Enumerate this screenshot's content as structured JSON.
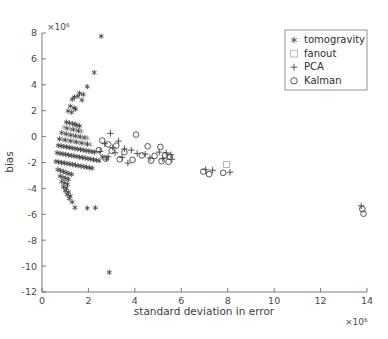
{
  "chart_data": {
    "type": "scatter",
    "title": "",
    "xlabel": "standard deviation in error",
    "ylabel": "bias",
    "x_exponent": "×10⁶",
    "y_exponent": "×10⁶",
    "xlim": [
      0,
      14
    ],
    "ylim": [
      -12,
      8
    ],
    "xticks": [
      0,
      2,
      4,
      6,
      8,
      10,
      12,
      14
    ],
    "yticks": [
      -12,
      -10,
      -8,
      -6,
      -4,
      -2,
      0,
      2,
      4,
      6,
      8
    ],
    "xticklabels": [
      "0",
      "2",
      "4",
      "6",
      "8",
      "10",
      "12",
      "14"
    ],
    "yticklabels": [
      "-12",
      "-10",
      "-8",
      "-6",
      "-4",
      "-2",
      "0",
      "2",
      "4",
      "6",
      "8"
    ],
    "grid": false,
    "legend_position": "upper right",
    "units_note": "axis values in units of 1e6",
    "series": [
      {
        "name": "tomogravity",
        "marker": "asterisk",
        "color": "#3a3a3a",
        "points": [
          [
            2.55,
            7.75
          ],
          [
            2.25,
            4.95
          ],
          [
            1.95,
            3.85
          ],
          [
            1.62,
            3.35
          ],
          [
            1.78,
            3.25
          ],
          [
            1.55,
            3.12
          ],
          [
            1.4,
            3.05
          ],
          [
            1.3,
            2.88
          ],
          [
            1.72,
            2.82
          ],
          [
            1.22,
            2.35
          ],
          [
            1.38,
            2.22
          ],
          [
            1.45,
            2.12
          ],
          [
            1.12,
            1.98
          ],
          [
            1.28,
            1.88
          ],
          [
            1.05,
            1.12
          ],
          [
            1.18,
            1.05
          ],
          [
            1.32,
            1.0
          ],
          [
            1.42,
            0.95
          ],
          [
            1.5,
            0.88
          ],
          [
            1.62,
            0.82
          ],
          [
            0.95,
            0.72
          ],
          [
            1.08,
            0.65
          ],
          [
            1.22,
            0.6
          ],
          [
            1.35,
            0.55
          ],
          [
            1.48,
            0.5
          ],
          [
            1.58,
            0.45
          ],
          [
            1.7,
            0.4
          ],
          [
            0.85,
            0.3
          ],
          [
            0.95,
            0.25
          ],
          [
            1.05,
            0.2
          ],
          [
            1.15,
            0.15
          ],
          [
            1.25,
            0.12
          ],
          [
            1.35,
            0.08
          ],
          [
            1.45,
            0.05
          ],
          [
            1.55,
            0.02
          ],
          [
            1.65,
            -0.02
          ],
          [
            1.75,
            -0.05
          ],
          [
            1.85,
            -0.08
          ],
          [
            1.95,
            -0.12
          ],
          [
            0.75,
            -0.18
          ],
          [
            0.88,
            -0.22
          ],
          [
            1.0,
            -0.26
          ],
          [
            1.12,
            -0.3
          ],
          [
            1.24,
            -0.34
          ],
          [
            1.36,
            -0.38
          ],
          [
            1.48,
            -0.42
          ],
          [
            1.6,
            -0.46
          ],
          [
            1.72,
            -0.5
          ],
          [
            1.84,
            -0.54
          ],
          [
            1.96,
            -0.58
          ],
          [
            2.08,
            -0.62
          ],
          [
            0.7,
            -0.68
          ],
          [
            0.82,
            -0.72
          ],
          [
            0.94,
            -0.76
          ],
          [
            1.06,
            -0.8
          ],
          [
            1.18,
            -0.84
          ],
          [
            1.3,
            -0.88
          ],
          [
            1.42,
            -0.92
          ],
          [
            1.54,
            -0.96
          ],
          [
            1.66,
            -1.0
          ],
          [
            1.78,
            -1.04
          ],
          [
            1.9,
            -1.08
          ],
          [
            2.02,
            -1.12
          ],
          [
            2.14,
            -1.16
          ],
          [
            2.26,
            -1.2
          ],
          [
            0.65,
            -1.25
          ],
          [
            0.78,
            -1.3
          ],
          [
            0.9,
            -1.34
          ],
          [
            1.02,
            -1.38
          ],
          [
            1.14,
            -1.42
          ],
          [
            1.26,
            -1.46
          ],
          [
            1.38,
            -1.5
          ],
          [
            1.5,
            -1.54
          ],
          [
            1.62,
            -1.58
          ],
          [
            1.74,
            -1.62
          ],
          [
            1.86,
            -1.66
          ],
          [
            1.98,
            -1.7
          ],
          [
            2.1,
            -1.74
          ],
          [
            2.22,
            -1.78
          ],
          [
            2.34,
            -1.82
          ],
          [
            2.46,
            -1.86
          ],
          [
            0.6,
            -1.92
          ],
          [
            0.72,
            -1.96
          ],
          [
            0.84,
            -2.0
          ],
          [
            0.96,
            -2.04
          ],
          [
            1.08,
            -2.08
          ],
          [
            1.2,
            -2.12
          ],
          [
            1.32,
            -2.16
          ],
          [
            1.44,
            -2.2
          ],
          [
            1.56,
            -2.24
          ],
          [
            1.68,
            -2.28
          ],
          [
            1.8,
            -2.32
          ],
          [
            1.92,
            -2.36
          ],
          [
            2.04,
            -2.4
          ],
          [
            2.16,
            -2.44
          ],
          [
            2.6,
            -1.55
          ],
          [
            2.78,
            -1.7
          ],
          [
            0.68,
            -2.55
          ],
          [
            0.8,
            -2.62
          ],
          [
            0.92,
            -2.7
          ],
          [
            1.04,
            -2.78
          ],
          [
            1.16,
            -2.86
          ],
          [
            1.28,
            -2.92
          ],
          [
            0.78,
            -3.05
          ],
          [
            0.9,
            -3.15
          ],
          [
            1.02,
            -3.22
          ],
          [
            1.14,
            -3.3
          ],
          [
            0.85,
            -3.48
          ],
          [
            0.98,
            -3.58
          ],
          [
            1.1,
            -3.68
          ],
          [
            0.92,
            -3.88
          ],
          [
            1.05,
            -3.98
          ],
          [
            1.0,
            -4.18
          ],
          [
            1.14,
            -4.28
          ],
          [
            1.08,
            -4.48
          ],
          [
            1.22,
            -4.58
          ],
          [
            1.18,
            -4.78
          ],
          [
            1.3,
            -5.05
          ],
          [
            1.42,
            -5.48
          ],
          [
            1.95,
            -5.52
          ],
          [
            2.3,
            -5.5
          ],
          [
            2.9,
            -10.48
          ]
        ]
      },
      {
        "name": "fanout",
        "marker": "square",
        "color": "#b0b0b0",
        "points": [
          [
            7.95,
            -2.15
          ]
        ]
      },
      {
        "name": "PCA",
        "marker": "plus",
        "color": "#3a3a3a",
        "points": [
          [
            2.95,
            0.25
          ],
          [
            3.3,
            -0.35
          ],
          [
            2.7,
            -0.55
          ],
          [
            3.05,
            -0.85
          ],
          [
            3.55,
            -0.95
          ],
          [
            3.85,
            -1.05
          ],
          [
            2.5,
            -1.15
          ],
          [
            3.15,
            -1.25
          ],
          [
            4.1,
            -1.3
          ],
          [
            4.45,
            -1.35
          ],
          [
            5.05,
            -1.2
          ],
          [
            5.35,
            -1.25
          ],
          [
            5.55,
            -1.4
          ],
          [
            2.85,
            -1.55
          ],
          [
            3.45,
            -1.6
          ],
          [
            4.65,
            -1.65
          ],
          [
            5.2,
            -1.7
          ],
          [
            5.6,
            -1.75
          ],
          [
            3.7,
            -2.05
          ],
          [
            7.05,
            -2.55
          ],
          [
            7.35,
            -2.6
          ],
          [
            8.1,
            -2.75
          ],
          [
            13.75,
            -5.35
          ]
        ]
      },
      {
        "name": "Kalman",
        "marker": "circle",
        "color": "#3a3a3a",
        "points": [
          [
            4.05,
            0.15
          ],
          [
            2.6,
            -0.3
          ],
          [
            2.85,
            -0.6
          ],
          [
            3.2,
            -0.7
          ],
          [
            4.55,
            -0.75
          ],
          [
            5.1,
            -0.8
          ],
          [
            2.45,
            -1.05
          ],
          [
            3.0,
            -1.1
          ],
          [
            3.55,
            -1.2
          ],
          [
            4.3,
            -1.45
          ],
          [
            4.85,
            -1.5
          ],
          [
            5.3,
            -1.45
          ],
          [
            5.5,
            -1.55
          ],
          [
            2.75,
            -1.7
          ],
          [
            3.35,
            -1.75
          ],
          [
            3.9,
            -1.8
          ],
          [
            4.7,
            -1.85
          ],
          [
            5.15,
            -1.9
          ],
          [
            5.45,
            -1.95
          ],
          [
            6.95,
            -2.7
          ],
          [
            7.2,
            -2.9
          ],
          [
            7.8,
            -2.8
          ],
          [
            13.8,
            -5.6
          ],
          [
            13.85,
            -5.95
          ]
        ]
      }
    ]
  },
  "legend": {
    "entries": [
      {
        "label": "tomogravity",
        "marker": "asterisk"
      },
      {
        "label": "fanout",
        "marker": "square"
      },
      {
        "label": "PCA",
        "marker": "plus"
      },
      {
        "label": "Kalman",
        "marker": "circle"
      }
    ]
  }
}
